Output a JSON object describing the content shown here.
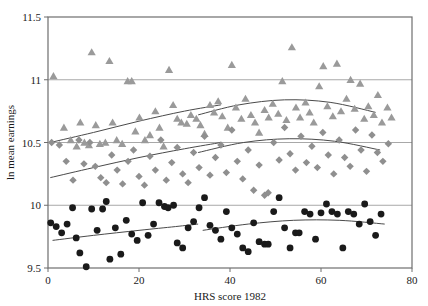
{
  "chart_data": {
    "type": "scatter",
    "title": "",
    "xlabel": "HRS score 1982",
    "ylabel": "ln mean earnings",
    "xlim": [
      0,
      80
    ],
    "ylim": [
      9.5,
      11.5
    ],
    "xticks": [
      0,
      20,
      40,
      60,
      80
    ],
    "yticks": [
      9.5,
      10,
      10.5,
      11,
      11.5
    ],
    "xtick_labels": [
      "0",
      "20",
      "40",
      "60",
      "80"
    ],
    "ytick_labels": [
      "9.5",
      "10",
      "10.5",
      "11",
      "11.5"
    ],
    "grid": "horizontal",
    "legend": "none",
    "colors": {
      "triangle": "#9a9a9a",
      "diamond": "#8f8f8f",
      "circle": "#1a1a1a",
      "trendline": "#4a4a4a",
      "gridline": "#a8a8a8",
      "frame": "#6e6e6e"
    },
    "series": [
      {
        "name": "triangles",
        "marker": "triangle",
        "color": "#9a9a9a",
        "points": [
          [
            1.2,
            11.03
          ],
          [
            3.5,
            10.62
          ],
          [
            5.0,
            10.52
          ],
          [
            6.3,
            10.47
          ],
          [
            7.1,
            10.66
          ],
          [
            8.0,
            10.5
          ],
          [
            9.0,
            10.48
          ],
          [
            9.6,
            11.22
          ],
          [
            10.5,
            10.64
          ],
          [
            11.4,
            10.49
          ],
          [
            12.6,
            10.5
          ],
          [
            13.5,
            11.15
          ],
          [
            14.2,
            10.66
          ],
          [
            15.1,
            10.52
          ],
          [
            16.3,
            10.49
          ],
          [
            17.5,
            10.99
          ],
          [
            18.4,
            10.99
          ],
          [
            19.2,
            10.59
          ],
          [
            20.1,
            10.7
          ],
          [
            21.3,
            10.52
          ],
          [
            22.4,
            10.56
          ],
          [
            23.6,
            10.75
          ],
          [
            24.5,
            10.62
          ],
          [
            25.4,
            10.47
          ],
          [
            26.6,
            11.08
          ],
          [
            27.5,
            10.8
          ],
          [
            28.4,
            10.69
          ],
          [
            29.3,
            10.66
          ],
          [
            30.5,
            10.65
          ],
          [
            31.4,
            10.72
          ],
          [
            32.6,
            10.69
          ],
          [
            33.5,
            10.64
          ],
          [
            34.4,
            10.57
          ],
          [
            35.6,
            10.8
          ],
          [
            36.5,
            10.74
          ],
          [
            37.4,
            10.83
          ],
          [
            38.3,
            10.71
          ],
          [
            39.5,
            10.62
          ],
          [
            40.4,
            11.12
          ],
          [
            41.3,
            10.78
          ],
          [
            42.5,
            10.69
          ],
          [
            43.4,
            10.85
          ],
          [
            44.6,
            10.72
          ],
          [
            45.5,
            10.66
          ],
          [
            46.4,
            10.58
          ],
          [
            47.6,
            10.76
          ],
          [
            48.5,
            10.7
          ],
          [
            49.4,
            10.81
          ],
          [
            50.6,
            10.73
          ],
          [
            51.5,
            10.99
          ],
          [
            52.4,
            10.68
          ],
          [
            53.6,
            11.26
          ],
          [
            54.5,
            10.78
          ],
          [
            55.4,
            10.7
          ],
          [
            56.6,
            10.82
          ],
          [
            57.5,
            10.74
          ],
          [
            58.4,
            10.66
          ],
          [
            59.6,
            10.95
          ],
          [
            60.5,
            11.11
          ],
          [
            61.4,
            10.79
          ],
          [
            62.6,
            10.71
          ],
          [
            63.5,
            11.13
          ],
          [
            64.4,
            10.75
          ],
          [
            65.6,
            10.85
          ],
          [
            66.5,
            11.0
          ],
          [
            67.4,
            10.77
          ],
          [
            68.6,
            10.97
          ],
          [
            69.5,
            10.69
          ],
          [
            70.4,
            10.79
          ],
          [
            71.6,
            10.72
          ],
          [
            72.5,
            10.88
          ],
          [
            73.4,
            10.66
          ],
          [
            74.6,
            10.78
          ],
          [
            75.5,
            10.7
          ]
        ]
      },
      {
        "name": "diamonds",
        "marker": "diamond",
        "color": "#8f8f8f",
        "points": [
          [
            0.8,
            10.5
          ],
          [
            2.5,
            10.48
          ],
          [
            4.0,
            10.35
          ],
          [
            5.5,
            10.2
          ],
          [
            6.8,
            10.52
          ],
          [
            7.9,
            10.33
          ],
          [
            9.2,
            10.5
          ],
          [
            10.4,
            10.31
          ],
          [
            11.6,
            10.22
          ],
          [
            12.8,
            10.18
          ],
          [
            14.0,
            10.4
          ],
          [
            15.2,
            10.28
          ],
          [
            16.4,
            10.17
          ],
          [
            17.6,
            10.35
          ],
          [
            18.8,
            10.44
          ],
          [
            20.0,
            10.23
          ],
          [
            21.2,
            10.16
          ],
          [
            22.4,
            10.39
          ],
          [
            23.6,
            10.28
          ],
          [
            24.8,
            10.52
          ],
          [
            26.0,
            10.2
          ],
          [
            27.2,
            10.34
          ],
          [
            28.4,
            10.46
          ],
          [
            29.6,
            10.25
          ],
          [
            30.8,
            10.18
          ],
          [
            32.0,
            10.42
          ],
          [
            33.2,
            10.3
          ],
          [
            34.4,
            10.55
          ],
          [
            35.6,
            10.24
          ],
          [
            36.8,
            10.38
          ],
          [
            38.0,
            10.48
          ],
          [
            39.2,
            10.26
          ],
          [
            40.4,
            10.6
          ],
          [
            41.6,
            10.35
          ],
          [
            42.8,
            10.21
          ],
          [
            44.0,
            10.44
          ],
          [
            45.2,
            10.12
          ],
          [
            46.4,
            10.32
          ],
          [
            47.6,
            10.08
          ],
          [
            48.4,
            10.1
          ],
          [
            49.6,
            10.5
          ],
          [
            50.8,
            10.36
          ],
          [
            52.0,
            10.62
          ],
          [
            53.2,
            10.41
          ],
          [
            54.4,
            10.28
          ],
          [
            55.6,
            10.55
          ],
          [
            56.8,
            10.34
          ],
          [
            58.0,
            10.47
          ],
          [
            59.2,
            10.3
          ],
          [
            60.4,
            10.58
          ],
          [
            61.6,
            10.4
          ],
          [
            62.8,
            10.25
          ],
          [
            64.0,
            10.52
          ],
          [
            65.2,
            10.38
          ],
          [
            66.4,
            10.31
          ],
          [
            67.6,
            10.6
          ],
          [
            68.8,
            10.44
          ],
          [
            70.0,
            10.27
          ],
          [
            71.2,
            10.56
          ],
          [
            72.4,
            10.42
          ],
          [
            73.6,
            10.35
          ],
          [
            74.8,
            10.49
          ]
        ]
      },
      {
        "name": "circles",
        "marker": "circle",
        "color": "#1a1a1a",
        "points": [
          [
            0.6,
            9.86
          ],
          [
            1.8,
            9.83
          ],
          [
            3.0,
            9.78
          ],
          [
            4.2,
            9.85
          ],
          [
            5.4,
            9.98
          ],
          [
            6.2,
            9.74
          ],
          [
            7.0,
            9.62
          ],
          [
            8.4,
            9.51
          ],
          [
            9.6,
            9.97
          ],
          [
            10.8,
            9.8
          ],
          [
            12.0,
            9.97
          ],
          [
            12.8,
            10.03
          ],
          [
            13.6,
            9.57
          ],
          [
            14.8,
            9.82
          ],
          [
            16.0,
            9.61
          ],
          [
            17.2,
            9.88
          ],
          [
            18.4,
            9.77
          ],
          [
            19.6,
            9.72
          ],
          [
            20.8,
            10.02
          ],
          [
            22.0,
            9.76
          ],
          [
            23.2,
            9.85
          ],
          [
            24.4,
            10.02
          ],
          [
            25.6,
            9.99
          ],
          [
            26.4,
            9.98
          ],
          [
            27.6,
            10.0
          ],
          [
            28.4,
            9.7
          ],
          [
            29.6,
            9.66
          ],
          [
            30.8,
            9.82
          ],
          [
            32.0,
            9.87
          ],
          [
            33.2,
            9.98
          ],
          [
            34.4,
            10.06
          ],
          [
            35.6,
            9.84
          ],
          [
            36.8,
            9.8
          ],
          [
            38.0,
            9.73
          ],
          [
            39.2,
            9.95
          ],
          [
            40.4,
            9.82
          ],
          [
            41.6,
            9.77
          ],
          [
            42.8,
            9.66
          ],
          [
            44.0,
            9.63
          ],
          [
            45.2,
            9.86
          ],
          [
            46.4,
            9.71
          ],
          [
            47.6,
            9.69
          ],
          [
            48.4,
            9.69
          ],
          [
            49.6,
            9.95
          ],
          [
            50.8,
            10.06
          ],
          [
            52.0,
            9.82
          ],
          [
            53.2,
            9.66
          ],
          [
            54.4,
            9.78
          ],
          [
            55.2,
            9.78
          ],
          [
            56.4,
            9.95
          ],
          [
            57.6,
            9.93
          ],
          [
            58.8,
            9.73
          ],
          [
            60.0,
            9.94
          ],
          [
            61.2,
            10.01
          ],
          [
            62.4,
            9.95
          ],
          [
            63.6,
            9.93
          ],
          [
            64.8,
            9.66
          ],
          [
            66.0,
            9.95
          ],
          [
            67.2,
            9.93
          ],
          [
            68.4,
            9.85
          ],
          [
            69.6,
            10.01
          ],
          [
            70.8,
            9.87
          ],
          [
            72.0,
            9.76
          ],
          [
            73.2,
            9.93
          ]
        ]
      }
    ],
    "trendlines": [
      {
        "name": "triangle-trend-left",
        "series": "triangles",
        "points": [
          [
            0.5,
            10.5
          ],
          [
            10,
            10.58
          ],
          [
            20,
            10.67
          ],
          [
            30,
            10.75
          ],
          [
            38,
            10.8
          ]
        ]
      },
      {
        "name": "triangle-trend-right",
        "series": "triangles",
        "points": [
          [
            33,
            10.72
          ],
          [
            42,
            10.8
          ],
          [
            52,
            10.84
          ],
          [
            62,
            10.82
          ],
          [
            72,
            10.74
          ]
        ]
      },
      {
        "name": "diamond-trend-left",
        "series": "diamonds",
        "points": [
          [
            0.5,
            10.22
          ],
          [
            10,
            10.3
          ],
          [
            20,
            10.38
          ],
          [
            30,
            10.45
          ],
          [
            38,
            10.5
          ]
        ]
      },
      {
        "name": "diamond-trend-right",
        "series": "diamonds",
        "points": [
          [
            33,
            10.42
          ],
          [
            43,
            10.5
          ],
          [
            53,
            10.53
          ],
          [
            63,
            10.51
          ],
          [
            73,
            10.44
          ]
        ]
      },
      {
        "name": "circle-trend-left",
        "series": "circles",
        "points": [
          [
            1,
            9.72
          ],
          [
            10,
            9.76
          ],
          [
            20,
            9.8
          ],
          [
            28,
            9.83
          ],
          [
            33,
            9.85
          ]
        ]
      },
      {
        "name": "circle-trend-right",
        "series": "circles",
        "points": [
          [
            34,
            9.8
          ],
          [
            44,
            9.85
          ],
          [
            54,
            9.88
          ],
          [
            64,
            9.88
          ],
          [
            74,
            9.85
          ]
        ]
      }
    ]
  }
}
